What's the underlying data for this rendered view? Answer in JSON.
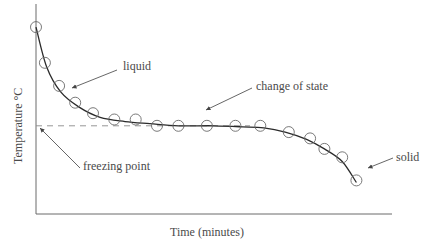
{
  "chart_data": {
    "type": "scatter",
    "title": "",
    "subtitle": "Cooling curve with fitted line",
    "xlabel": "Time (minutes)",
    "ylabel": "Temperature °C",
    "grid": false,
    "legend": null,
    "xlim": [
      0,
      100
    ],
    "ylim": [
      0,
      100
    ],
    "axis_ticks": "none",
    "freezing_point_level": 42,
    "series": [
      {
        "name": "measurements",
        "marker": "open-circle",
        "x": [
          0,
          2.5,
          6.5,
          11,
          16,
          22,
          28,
          34,
          40,
          48,
          56,
          63,
          71,
          77,
          81,
          86,
          90
        ],
        "y": [
          89,
          72,
          61,
          53,
          48,
          45,
          45,
          42,
          42,
          42,
          42,
          42,
          39,
          36,
          31,
          27,
          16
        ]
      },
      {
        "name": "fitted curve",
        "style": "solid-line",
        "x": [
          0,
          3,
          7,
          12,
          18,
          25,
          32,
          40,
          50,
          58,
          64,
          70,
          76,
          81,
          86,
          90
        ],
        "y": [
          89,
          70,
          58,
          51,
          46,
          44,
          43,
          42,
          42,
          41.5,
          41,
          39,
          35.5,
          31,
          25,
          15
        ]
      }
    ],
    "annotations": [
      {
        "text": "liquid",
        "points_to": "cooling liquid segment"
      },
      {
        "text": "change of state",
        "points_to": "plateau segment"
      },
      {
        "text": "solid",
        "points_to": "cooling solid segment"
      },
      {
        "text": "freezing point",
        "points_to": "dashed horizontal line at plateau level"
      }
    ]
  },
  "labels": {
    "liquid": "liquid",
    "change_of_state": "change of state",
    "solid": "solid",
    "freezing_point": "freezing point",
    "x_axis": "Time (minutes)",
    "y_axis": "Temperature °C"
  },
  "colors": {
    "axis": "#6a6a6a",
    "curve": "#2a2a2a",
    "markers": "#6a6a6a",
    "text": "#4a4a4a"
  }
}
